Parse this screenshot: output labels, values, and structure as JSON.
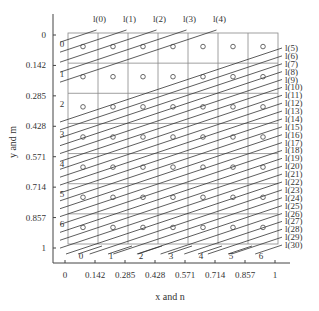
{
  "chart_data": {
    "type": "diagram",
    "title": "",
    "xlabel": "x and n",
    "ylabel": "y and m",
    "x_ticks": [
      "0",
      "0.142",
      "0.285",
      "0.428",
      "0.571",
      "0.714",
      "0.857",
      "1"
    ],
    "y_ticks": [
      "0",
      "0.142",
      "0.285",
      "0.428",
      "0.571",
      "0.714",
      "0.857",
      "1"
    ],
    "grid": {
      "columns": 7,
      "rows": 7,
      "column_labels": [
        "0",
        "1",
        "2",
        "3",
        "4",
        "5",
        "6"
      ],
      "row_labels": [
        "0",
        "1",
        "2",
        "3",
        "4",
        "5",
        "6"
      ]
    },
    "cell_markers": "circle at center of each of 49 cells",
    "lines": {
      "count": 31,
      "labels": [
        "l(0)",
        "l(1)",
        "l(2)",
        "l(3)",
        "l(4)",
        "l(5)",
        "l(6)",
        "l(7)",
        "l(8)",
        "l(9)",
        "l(10)",
        "l(11)",
        "l(12)",
        "l(13)",
        "l(14)",
        "l(15)",
        "l(16)",
        "l(17)",
        "l(18)",
        "l(19)",
        "l(20)",
        "l(21)",
        "l(22)",
        "l(23)",
        "l(24)",
        "l(25)",
        "l(26)",
        "l(27)",
        "l(28)",
        "l(29)",
        "l(30)"
      ],
      "slope_description": "parallel lines rising to the right with slope about 1/3"
    }
  },
  "labels": {
    "xlabel": "x and n",
    "ylabel": "y and m"
  }
}
